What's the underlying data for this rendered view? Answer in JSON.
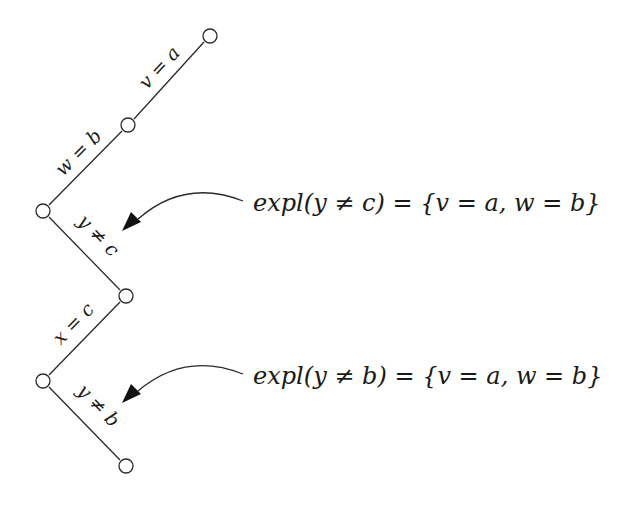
{
  "diagram": {
    "type": "search-branch-tree",
    "nodes": [
      {
        "id": "n1",
        "x": 210,
        "y": 36
      },
      {
        "id": "n2",
        "x": 128,
        "y": 125
      },
      {
        "id": "n3",
        "x": 43,
        "y": 211
      },
      {
        "id": "n4",
        "x": 126,
        "y": 296
      },
      {
        "id": "n5",
        "x": 43,
        "y": 381
      },
      {
        "id": "n6",
        "x": 126,
        "y": 466
      }
    ],
    "edges": [
      {
        "from": "n1",
        "to": "n2",
        "label": "v = a"
      },
      {
        "from": "n2",
        "to": "n3",
        "label": "w = b"
      },
      {
        "from": "n3",
        "to": "n4",
        "label": "y ≠ c"
      },
      {
        "from": "n4",
        "to": "n5",
        "label": "x = c"
      },
      {
        "from": "n5",
        "to": "n6",
        "label": "y ≠ b"
      }
    ],
    "annotations": [
      {
        "target_edge": "y ≠ c",
        "text": "expl(y ≠ c) = {v = a, w = b}"
      },
      {
        "target_edge": "y ≠ b",
        "text": "expl(y ≠ b) = {v = a, w = b}"
      }
    ]
  },
  "labels": {
    "e1": "v = a",
    "e2": "w = b",
    "e3": "y ≠ c",
    "e4": "x = c",
    "e5": "y ≠ b"
  },
  "explanations": {
    "top": "expl(y ≠ c) = {v = a, w = b}",
    "bottom": "expl(y ≠ b) = {v = a, w = b}"
  },
  "colors": {
    "stroke": "#2a2a2a",
    "background": "#ffffff"
  }
}
